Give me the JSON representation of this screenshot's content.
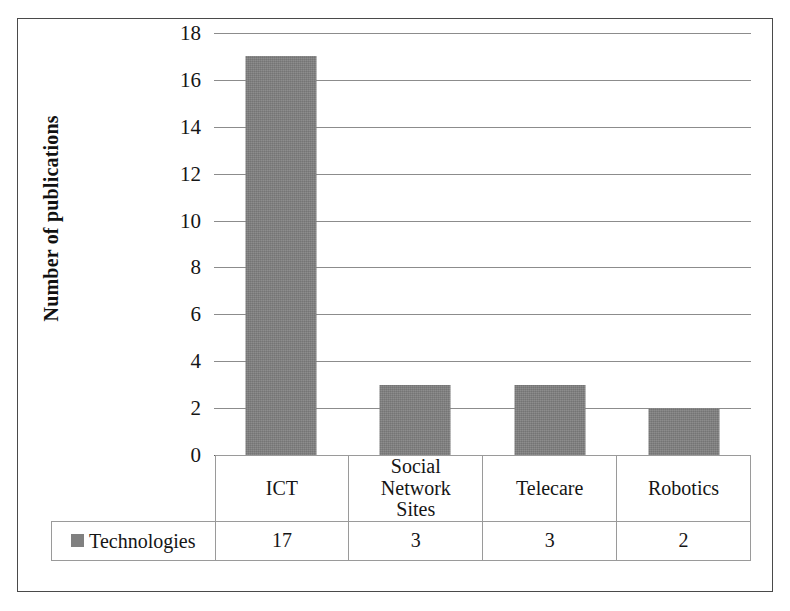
{
  "chart_data": {
    "type": "bar",
    "title": "",
    "xlabel": "",
    "ylabel": "Number of publications",
    "categories": [
      "ICT",
      "Social Network Sites",
      "Telecare",
      "Robotics"
    ],
    "category_lines": [
      [
        "ICT"
      ],
      [
        "Social",
        "Network",
        "Sites"
      ],
      [
        "Telecare"
      ],
      [
        "Robotics"
      ]
    ],
    "values": [
      17,
      3,
      3,
      2
    ],
    "series": [
      {
        "name": "Technologies",
        "values": [
          17,
          3,
          3,
          2
        ],
        "color": "#808080"
      }
    ],
    "ylim": [
      0,
      18
    ],
    "ytick_step": 2,
    "yticks": [
      0,
      2,
      4,
      6,
      8,
      10,
      12,
      14,
      16,
      18
    ],
    "ytick_labels": [
      "0",
      "2",
      "4",
      "6",
      "8",
      "10",
      "12",
      "14",
      "16",
      "18"
    ],
    "grid": true,
    "grid_axis": "y",
    "legend": {
      "position": "bottom-left-table",
      "entries": [
        "Technologies"
      ]
    },
    "has_data_table": true
  },
  "axis": {
    "y_title": "Number of publications"
  },
  "table": {
    "legend_label": "Technologies",
    "category_row": [
      "ICT",
      "Social Network Sites",
      "Telecare",
      "Robotics"
    ],
    "value_row": [
      "17",
      "3",
      "3",
      "2"
    ]
  },
  "colors": {
    "bar_fill": "#808080",
    "gridline": "#8c8c8c",
    "frame": "#4a4a4a",
    "table_border": "#9a9a9a",
    "text": "#151515",
    "background": "#ffffff"
  }
}
